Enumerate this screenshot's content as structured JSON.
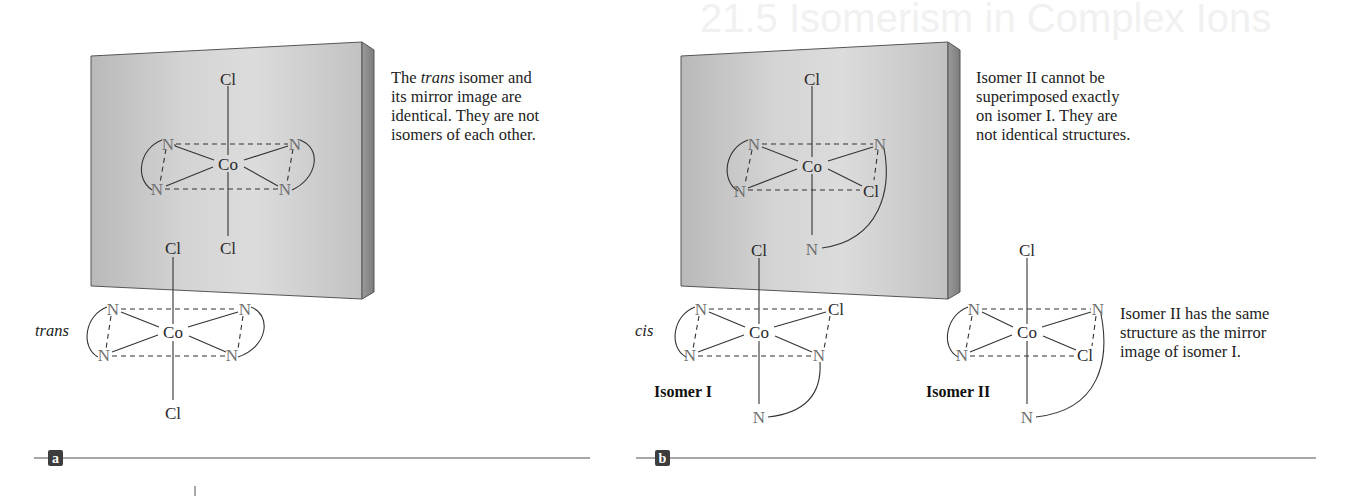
{
  "background_ghost_text": "21.5 Isomerism in Complex Ions",
  "panels": [
    {
      "id": "a",
      "label": "a",
      "caption_parts": [
        "The ",
        "trans",
        " isomer and its mirror image are identical. They are not isomers of each other."
      ],
      "caption_lines": [
        "The trans isomer and",
        "its mirror image are",
        "identical. They are not",
        "isomers of each other."
      ],
      "molecule_label": "trans",
      "reflected_molecule": {
        "top": "Cl",
        "bottom": "Cl",
        "center": "Co",
        "eq_top_left": "N",
        "eq_top_right": "N",
        "eq_bottom_left": "N",
        "eq_bottom_right": "N"
      },
      "front_molecule": {
        "top": "Cl",
        "bottom": "Cl",
        "center": "Co",
        "eq_top_left": "N",
        "eq_top_right": "N",
        "eq_bottom_left": "N",
        "eq_bottom_right": "N"
      }
    },
    {
      "id": "b",
      "label": "b",
      "caption_lines": [
        "Isomer II cannot be",
        "superimposed exactly",
        "on isomer I. They are",
        "not identical structures."
      ],
      "molecule_label": "cis",
      "isomer_I_label": "Isomer I",
      "isomer_II_label": "Isomer II",
      "isomer_II_caption_lines": [
        "Isomer II has the same",
        "structure as the mirror",
        "image of isomer I."
      ],
      "reflected_molecule": {
        "top": "Cl",
        "bottom": "N",
        "center": "Co",
        "eq_top_left": "N",
        "eq_top_right": "N",
        "eq_bottom_left": "N",
        "eq_bottom_right": "Cl"
      },
      "isomer_I": {
        "top": "Cl",
        "bottom": "N",
        "center": "Co",
        "eq_top_left": "N",
        "eq_top_right": "Cl",
        "eq_bottom_left": "N",
        "eq_bottom_right": "N"
      },
      "isomer_II": {
        "top": "Cl",
        "bottom": "N",
        "center": "Co",
        "eq_top_left": "N",
        "eq_top_right": "N",
        "eq_bottom_left": "N",
        "eq_bottom_right": "Cl"
      }
    }
  ],
  "colors": {
    "mirror_face": "#c9c9c9",
    "mirror_face_light": "#dedede",
    "mirror_side": "#8f8f8f",
    "mirror_edge": "#5a5a5a",
    "atom_N": "#6f6f6f",
    "atom_text": "#2a2a2a",
    "rule": "#8a8a8a",
    "label_box": "#3d3d3d"
  }
}
